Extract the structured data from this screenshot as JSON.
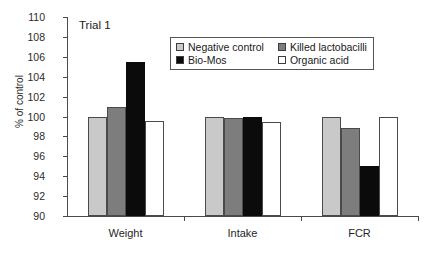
{
  "chart_data": {
    "type": "bar",
    "title": "Trial 1",
    "xlabel": "",
    "ylabel": "% of control",
    "ylim": [
      90,
      110
    ],
    "yticks": [
      90,
      92,
      94,
      96,
      98,
      100,
      102,
      104,
      106,
      108,
      110
    ],
    "grid": false,
    "legend_position": "top-center-inside",
    "categories": [
      "Weight",
      "Intake",
      "FCR"
    ],
    "series": [
      {
        "name": "Negative control",
        "color": "#c9c9c9",
        "values": [
          100.0,
          100.0,
          100.0
        ]
      },
      {
        "name": "Killed lactobacilli",
        "color": "#7d7d7d",
        "values": [
          101.0,
          99.8,
          98.8
        ]
      },
      {
        "name": "Bio-Mos",
        "color": "#0b0b0b",
        "values": [
          105.5,
          100.0,
          95.0
        ]
      },
      {
        "name": "Organic acid",
        "color": "#ffffff",
        "values": [
          99.5,
          99.4,
          100.0
        ]
      }
    ]
  },
  "legend": {
    "entries": [
      {
        "label": "Negative control",
        "swatch": "light-gray-swatch"
      },
      {
        "label": "Killed lactobacilli",
        "swatch": "medium-gray-swatch"
      },
      {
        "label": "Bio-Mos",
        "swatch": "black-swatch"
      },
      {
        "label": "Organic acid",
        "swatch": "white-swatch"
      }
    ]
  },
  "axis": {
    "y_labels": [
      "110",
      "108",
      "106",
      "104",
      "102",
      "100",
      "98",
      "96",
      "94",
      "92",
      "90"
    ],
    "y_title": "% of control",
    "x_labels": [
      "Weight",
      "Intake",
      "FCR"
    ]
  }
}
